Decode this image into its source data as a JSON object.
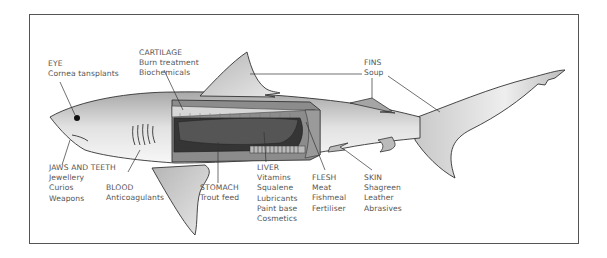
{
  "diagram": {
    "labels": {
      "eye": {
        "title": "EYE",
        "uses": [
          "Cornea tansplants"
        ]
      },
      "cartilage": {
        "title": "CARTILAGE",
        "uses": [
          "Burn treatment",
          "Biochemicals"
        ]
      },
      "fins": {
        "title": "FINS",
        "uses": [
          "Soup"
        ]
      },
      "jaws": {
        "title": "JAWS AND TEETH",
        "uses": [
          "Jewellery",
          "Curios",
          "Weapons"
        ]
      },
      "blood": {
        "title": "BLOOD",
        "uses": [
          "Anticoagulants"
        ]
      },
      "stomach": {
        "title": "STOMACH",
        "uses": [
          "Trout feed"
        ]
      },
      "liver": {
        "title": "LIVER",
        "uses": [
          "Vitamins",
          "Squalene",
          "Lubricants",
          "Paint base",
          "Cosmetics"
        ]
      },
      "flesh": {
        "title": "FLESH",
        "uses": [
          "Meat",
          "Fishmeal",
          "Fertiliser"
        ]
      },
      "skin": {
        "title": "SKIN",
        "uses": [
          "Shagreen",
          "Leather",
          "Abrasives"
        ]
      }
    },
    "colors": {
      "frame": "#555555",
      "outline": "#333333",
      "body_light": "#f4f4f4",
      "body_dark": "#a9a9a9",
      "cavity": "#3a3a3a",
      "liver": "#555555",
      "text": "#555555"
    }
  }
}
